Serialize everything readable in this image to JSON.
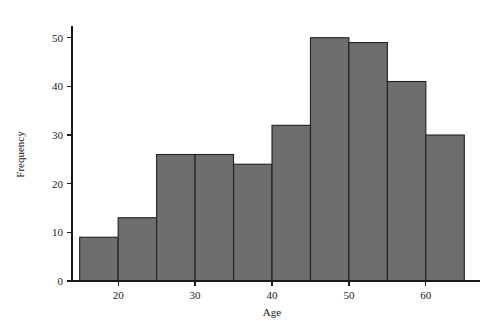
{
  "chart_data": {
    "type": "bar",
    "title": "",
    "subtitle": "",
    "xlabel": "Age",
    "ylabel": "Frequency",
    "bin_width": 5,
    "bin_edges": [
      15,
      20,
      25,
      30,
      35,
      40,
      45,
      50,
      55,
      60,
      65
    ],
    "categories": [
      "15-20",
      "20-25",
      "25-30",
      "30-35",
      "35-40",
      "40-45",
      "45-50",
      "50-55",
      "55-60",
      "60-65"
    ],
    "values": [
      9,
      13,
      26,
      26,
      24,
      32,
      50,
      49,
      41,
      30
    ],
    "xlim": [
      14,
      66
    ],
    "ylim": [
      0,
      52
    ],
    "xticks": [
      20,
      30,
      40,
      50,
      60
    ],
    "xtick_labels": [
      "20",
      "30",
      "40",
      "50",
      "60"
    ],
    "yticks": [
      0,
      10,
      20,
      30,
      40,
      50
    ],
    "ytick_labels": [
      "0",
      "10",
      "20",
      "30",
      "40",
      "50"
    ],
    "grid": false,
    "legend": null,
    "legend_position": "none",
    "bar_fill_color": "#6e6e6e",
    "bar_edge_color": "#202020",
    "axis_color": "#1a1a1a",
    "background_color": "#ffffff"
  }
}
